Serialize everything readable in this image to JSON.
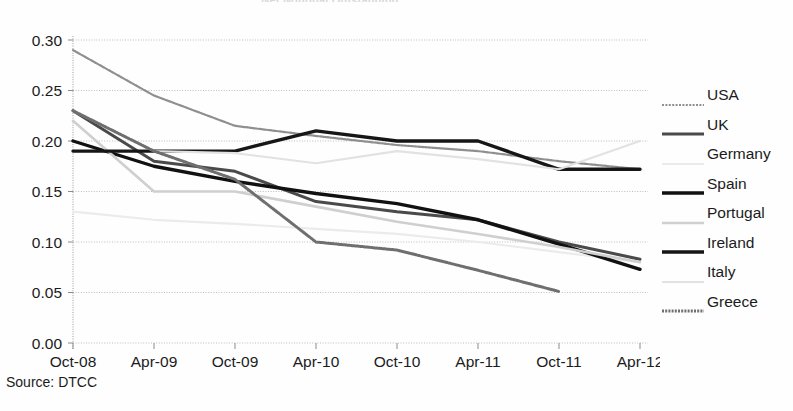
{
  "title": "Net Notional Outstanding",
  "source_note": "Source: DTCC",
  "legend": {
    "items": [
      {
        "label": "USA",
        "color": "#8f8f8f",
        "width": 2.2,
        "dash": "2,1.4"
      },
      {
        "label": "UK",
        "color": "#4a4a4a",
        "width": 3.0,
        "dash": "none"
      },
      {
        "label": "Germany",
        "color": "#ebebeb",
        "width": 2.2,
        "dash": "none"
      },
      {
        "label": "Spain",
        "color": "#111111",
        "width": 3.4,
        "dash": "none"
      },
      {
        "label": "Portugal",
        "color": "#cfcfcf",
        "width": 2.6,
        "dash": "none"
      },
      {
        "label": "Ireland",
        "color": "#161616",
        "width": 3.4,
        "dash": "none"
      },
      {
        "label": "Italy",
        "color": "#e2e2e2",
        "width": 2.2,
        "dash": "none"
      },
      {
        "label": "Greece",
        "color": "#6f6f6f",
        "width": 3.0,
        "dash": "2,1.2"
      }
    ]
  },
  "chart_data": {
    "type": "line",
    "title": "Net Notional Outstanding",
    "xlabel": "",
    "ylabel": "",
    "grid": true,
    "legend_position": "right",
    "ylim": [
      0.0,
      0.3
    ],
    "yticks": [
      "0.00",
      "0.05",
      "0.10",
      "0.15",
      "0.20",
      "0.25",
      "0.30"
    ],
    "ytick_values": [
      0.0,
      0.05,
      0.1,
      0.15,
      0.2,
      0.25,
      0.3
    ],
    "categories": [
      "Oct-08",
      "Apr-09",
      "Oct-09",
      "Apr-10",
      "Oct-10",
      "Apr-11",
      "Oct-11",
      "Apr-12"
    ],
    "series": [
      {
        "name": "USA",
        "values": [
          0.29,
          0.245,
          0.215,
          0.205,
          0.196,
          0.19,
          0.18,
          0.172
        ]
      },
      {
        "name": "UK",
        "values": [
          0.23,
          0.18,
          0.17,
          0.14,
          0.13,
          0.122,
          0.1,
          0.083
        ]
      },
      {
        "name": "Germany",
        "values": [
          0.13,
          0.122,
          0.118,
          0.113,
          0.108,
          0.1,
          0.09,
          0.08
        ]
      },
      {
        "name": "Spain",
        "values": [
          0.2,
          0.175,
          0.16,
          0.148,
          0.138,
          0.122,
          0.098,
          0.073
        ]
      },
      {
        "name": "Portugal",
        "values": [
          0.22,
          0.15,
          0.15,
          0.135,
          0.12,
          0.108,
          0.095,
          0.08
        ]
      },
      {
        "name": "Ireland",
        "values": [
          0.19,
          0.19,
          0.19,
          0.21,
          0.2,
          0.2,
          0.172,
          0.172
        ]
      },
      {
        "name": "Italy",
        "values": [
          0.23,
          0.19,
          0.188,
          0.178,
          0.19,
          0.182,
          0.172,
          0.2
        ]
      },
      {
        "name": "Greece",
        "values": [
          0.23,
          0.19,
          0.162,
          0.1,
          0.092,
          0.072,
          0.051,
          null
        ]
      }
    ]
  }
}
